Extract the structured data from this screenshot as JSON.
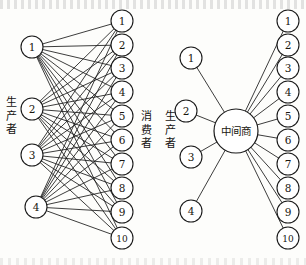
{
  "figure": {
    "title_visible": false,
    "background_color": "#fdfdfb",
    "ink_color": "#1a1a1a",
    "node_fill": "#ffffff"
  },
  "left_diagram": {
    "name": "direct-distribution-network",
    "producers": {
      "label_chars": [
        "生",
        "产",
        "者"
      ],
      "label_text": "生产者",
      "nodes": [
        {
          "id": "L1",
          "label": "1",
          "cx": 32,
          "cy": 47,
          "r": 11
        },
        {
          "id": "L2",
          "label": "2",
          "cx": 32,
          "cy": 109,
          "r": 11
        },
        {
          "id": "L3",
          "label": "3",
          "cx": 32,
          "cy": 155,
          "r": 11
        },
        {
          "id": "L4",
          "label": "4",
          "cx": 36,
          "cy": 207,
          "r": 11
        }
      ]
    },
    "consumers": {
      "label_chars": [
        "消",
        "费",
        "者"
      ],
      "label_text": "消费者",
      "nodes": [
        {
          "id": "R1",
          "label": "1",
          "cx": 122,
          "cy": 21,
          "r": 11
        },
        {
          "id": "R2",
          "label": "2",
          "cx": 122,
          "cy": 45,
          "r": 11
        },
        {
          "id": "R3",
          "label": "3",
          "cx": 122,
          "cy": 68,
          "r": 11
        },
        {
          "id": "R4",
          "label": "4",
          "cx": 122,
          "cy": 92,
          "r": 11
        },
        {
          "id": "R5",
          "label": "5",
          "cx": 122,
          "cy": 116,
          "r": 11
        },
        {
          "id": "R6",
          "label": "6",
          "cx": 122,
          "cy": 140,
          "r": 11
        },
        {
          "id": "R7",
          "label": "7",
          "cx": 122,
          "cy": 164,
          "r": 11
        },
        {
          "id": "R8",
          "label": "8",
          "cx": 122,
          "cy": 188,
          "r": 11
        },
        {
          "id": "R9",
          "label": "9",
          "cx": 122,
          "cy": 212,
          "r": 11
        },
        {
          "id": "R10",
          "label": "10",
          "cx": 122,
          "cy": 238,
          "r": 11
        }
      ]
    },
    "link_count": 40,
    "link_description": "every producer connects to every consumer (4 x 10)"
  },
  "right_diagram": {
    "name": "middleman-distribution-network",
    "producers": {
      "label_chars": [
        "生",
        "产",
        "者"
      ],
      "label_text": "生产者",
      "nodes": [
        {
          "id": "P1",
          "label": "1",
          "cx": 191,
          "cy": 58,
          "r": 11
        },
        {
          "id": "P2",
          "label": "2",
          "cx": 186,
          "cy": 111,
          "r": 11
        },
        {
          "id": "P3",
          "label": "3",
          "cx": 191,
          "cy": 157,
          "r": 11
        },
        {
          "id": "P4",
          "label": "4",
          "cx": 191,
          "cy": 211,
          "r": 11
        }
      ]
    },
    "hub": {
      "label": "中间商",
      "cx": 236,
      "cy": 131,
      "r": 22
    },
    "consumers": {
      "nodes": [
        {
          "id": "C1",
          "label": "1",
          "cx": 288,
          "cy": 21,
          "r": 11
        },
        {
          "id": "C2",
          "label": "2",
          "cx": 288,
          "cy": 45,
          "r": 11
        },
        {
          "id": "C3",
          "label": "3",
          "cx": 288,
          "cy": 68,
          "r": 11
        },
        {
          "id": "C4",
          "label": "4",
          "cx": 288,
          "cy": 92,
          "r": 11
        },
        {
          "id": "C5",
          "label": "5",
          "cx": 288,
          "cy": 116,
          "r": 11
        },
        {
          "id": "C6",
          "label": "6",
          "cx": 288,
          "cy": 140,
          "r": 11
        },
        {
          "id": "C7",
          "label": "7",
          "cx": 288,
          "cy": 164,
          "r": 11
        },
        {
          "id": "C8",
          "label": "8",
          "cx": 288,
          "cy": 188,
          "r": 11
        },
        {
          "id": "C9",
          "label": "9",
          "cx": 288,
          "cy": 212,
          "r": 11
        },
        {
          "id": "C10",
          "label": "10",
          "cx": 288,
          "cy": 238,
          "r": 11
        }
      ]
    },
    "link_count": 14,
    "link_description": "each producer and each consumer connects only to the middleman (4 + 10)"
  }
}
